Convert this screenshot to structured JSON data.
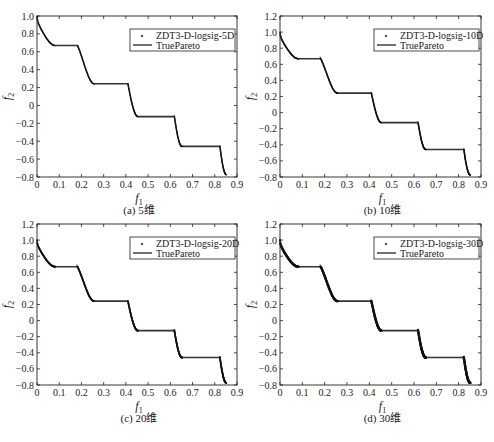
{
  "figure": {
    "background": "#ffffff",
    "axis_color": "#222222",
    "curve_color": "#333333",
    "point_color": "#111111"
  },
  "chart_data": [
    {
      "type": "line",
      "panel": "a",
      "caption": "(a) 5维",
      "xlabel": "f1",
      "ylabel": "f2",
      "xlim": [
        0,
        0.9
      ],
      "ylim": [
        -0.8,
        1.0
      ],
      "xticks": [
        "0",
        "0.1",
        "0.2",
        "0.3",
        "0.4",
        "0.5",
        "0.6",
        "0.7",
        "0.8",
        "0.9"
      ],
      "yticks": [
        "-0.8",
        "-0.6",
        "-0.4",
        "-0.2",
        "0",
        "0.2",
        "0.4",
        "0.6",
        "0.8",
        "1.0"
      ],
      "grid": false,
      "legend_position": "upper right",
      "series": [
        {
          "name": "ZDT3-D-logsig-5D",
          "style": "points"
        },
        {
          "name": "TruePareto",
          "style": "line"
        }
      ],
      "step_levels": [
        0.67,
        0.24,
        -0.13,
        -0.46,
        -0.77
      ],
      "segments_f1": [
        [
          0,
          0.083
        ],
        [
          0.182,
          0.258
        ],
        [
          0.409,
          0.454
        ],
        [
          0.618,
          0.653
        ],
        [
          0.823,
          0.852
        ]
      ]
    },
    {
      "type": "line",
      "panel": "b",
      "caption": "(b) 10维",
      "xlabel": "f1",
      "ylabel": "f2",
      "xlim": [
        0,
        0.9
      ],
      "ylim": [
        -0.8,
        1.2
      ],
      "xticks": [
        "0",
        "0.1",
        "0.2",
        "0.3",
        "0.4",
        "0.5",
        "0.6",
        "0.7",
        "0.8",
        "0.9"
      ],
      "yticks": [
        "-0.8",
        "-0.6",
        "-0.4",
        "-0.2",
        "0",
        "0.2",
        "0.4",
        "0.6",
        "0.8",
        "1.0",
        "1.2"
      ],
      "grid": false,
      "legend_position": "upper right",
      "series": [
        {
          "name": "ZDT3-D-logsig-10D",
          "style": "points"
        },
        {
          "name": "TruePareto",
          "style": "line"
        }
      ],
      "step_levels": [
        0.67,
        0.24,
        -0.13,
        -0.46,
        -0.77
      ],
      "segments_f1": [
        [
          0,
          0.083
        ],
        [
          0.182,
          0.258
        ],
        [
          0.409,
          0.454
        ],
        [
          0.618,
          0.653
        ],
        [
          0.823,
          0.852
        ]
      ]
    },
    {
      "type": "line",
      "panel": "c",
      "caption": "(c) 20维",
      "xlabel": "f1",
      "ylabel": "f2",
      "xlim": [
        0,
        0.9
      ],
      "ylim": [
        -0.8,
        1.2
      ],
      "xticks": [
        "0",
        "0.1",
        "0.2",
        "0.3",
        "0.4",
        "0.5",
        "0.6",
        "0.7",
        "0.8",
        "0.9"
      ],
      "yticks": [
        "-0.8",
        "-0.6",
        "-0.4",
        "-0.2",
        "0",
        "0.2",
        "0.4",
        "0.6",
        "0.8",
        "1.0",
        "1.2"
      ],
      "grid": false,
      "legend_position": "upper right",
      "series": [
        {
          "name": "ZDT3-D-logsig-20D",
          "style": "points"
        },
        {
          "name": "TruePareto",
          "style": "line"
        }
      ],
      "step_levels": [
        0.67,
        0.24,
        -0.13,
        -0.46,
        -0.77
      ],
      "segments_f1": [
        [
          0,
          0.083
        ],
        [
          0.182,
          0.258
        ],
        [
          0.409,
          0.454
        ],
        [
          0.618,
          0.653
        ],
        [
          0.823,
          0.852
        ]
      ]
    },
    {
      "type": "line",
      "panel": "d",
      "caption": "(d) 30维",
      "xlabel": "f1",
      "ylabel": "f2",
      "xlim": [
        0,
        0.9
      ],
      "ylim": [
        -0.8,
        1.2
      ],
      "xticks": [
        "0",
        "0.1",
        "0.2",
        "0.3",
        "0.4",
        "0.5",
        "0.6",
        "0.7",
        "0.8",
        "0.9"
      ],
      "yticks": [
        "-0.8",
        "-0.6",
        "-0.4",
        "-0.2",
        "0",
        "0.2",
        "0.4",
        "0.6",
        "0.8",
        "1.0",
        "1.2"
      ],
      "grid": false,
      "legend_position": "upper right",
      "series": [
        {
          "name": "ZDT3-D-logsig-30D",
          "style": "points"
        },
        {
          "name": "TruePareto",
          "style": "line"
        }
      ],
      "step_levels": [
        0.67,
        0.24,
        -0.13,
        -0.46,
        -0.77
      ],
      "segments_f1": [
        [
          0,
          0.083
        ],
        [
          0.182,
          0.258
        ],
        [
          0.409,
          0.454
        ],
        [
          0.618,
          0.653
        ],
        [
          0.823,
          0.852
        ]
      ]
    }
  ],
  "panels": [
    {
      "id": "a",
      "caption": "(a) 5维",
      "xlabel": "f",
      "xlabel_sub": "1",
      "ylabel": "f",
      "ylabel_sub": "2",
      "legend_points": "ZDT3-D-logsig-5D",
      "legend_line": "TruePareto"
    },
    {
      "id": "b",
      "caption": "(b) 10维",
      "xlabel": "f",
      "xlabel_sub": "1",
      "ylabel": "f",
      "ylabel_sub": "2",
      "legend_points": "ZDT3-D-logsig-10D",
      "legend_line": "TruePareto"
    },
    {
      "id": "c",
      "caption": "(c) 20维",
      "xlabel": "f",
      "xlabel_sub": "1",
      "ylabel": "f",
      "ylabel_sub": "2",
      "legend_points": "ZDT3-D-logsig-20D",
      "legend_line": "TruePareto"
    },
    {
      "id": "d",
      "caption": "(d) 30维",
      "xlabel": "f",
      "xlabel_sub": "1",
      "ylabel": "f",
      "ylabel_sub": "2",
      "legend_points": "ZDT3-D-logsig-30D",
      "legend_line": "TruePareto"
    }
  ]
}
